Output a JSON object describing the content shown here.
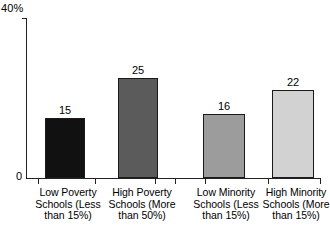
{
  "chart_data": {
    "type": "bar",
    "title": "",
    "xlabel": "",
    "ylabel": "",
    "ylim": [
      0,
      40
    ],
    "grid": false,
    "legend": "none",
    "y_axis_ticks": [
      "0",
      "40%"
    ],
    "y_top_label": "40%",
    "y_zero_label": "0",
    "categories": [
      "Low Poverty\nSchools (Less\nthan 15%)",
      "High Poverty\nSchools (More\nthan 50%)",
      "Low Minority\nSchools (Less\nthan 15%)",
      "High Minority\nSchools (More\nthan 15%)"
    ],
    "values": [
      15,
      25,
      16,
      22
    ],
    "value_labels": [
      "15",
      "25",
      "16",
      "22"
    ],
    "bar_colors": [
      "#111111",
      "#5b5b5b",
      "#9c9c9c",
      "#d2d2d2"
    ],
    "bar_border_color": "#1a1a1a",
    "axis_color": "#222222"
  }
}
